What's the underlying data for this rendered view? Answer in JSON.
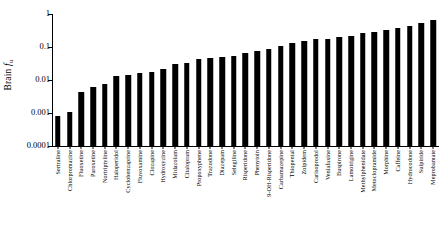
{
  "chart_data": {
    "type": "bar",
    "title": "",
    "subtitle": "",
    "xlabel": "",
    "ylabel": "Brain fu",
    "ylabel_parts": {
      "prefix": "Brain ",
      "italic": "f",
      "subscript": "u"
    },
    "yscale": "log",
    "ylim": [
      0.0001,
      1
    ],
    "ytick_labels": [
      "1",
      "0.1",
      "0.01",
      "0.001",
      "0.0001"
    ],
    "ytick_values": [
      1,
      0.1,
      0.01,
      0.001,
      0.0001
    ],
    "grid": false,
    "legend": null,
    "bar_color": "#000000",
    "categories": [
      "Sertraline",
      "Chlorpromazine",
      "Fluoxetine",
      "Paroxetine",
      "Nortriptyline",
      "Haloperidol",
      "Cyclobenzaprine",
      "Fluvoxamine",
      "Clozapine",
      "Hydroxyzine",
      "Midazolam",
      "Citalopram",
      "Propoxyphene",
      "Trazodone",
      "Diazepam",
      "Selegiline",
      "Risperidone",
      "Phenytoin",
      "9-OH-Risperidone",
      "Carbamazepine",
      "Thiopental",
      "Zolpidem",
      "Carisoprodol",
      "Venlafaxine",
      "Buspirone",
      "Lamotrigine",
      "Methylphenidate",
      "Metoclopramide",
      "Morphine",
      "Caffeine",
      "Hydrocodone",
      "Sulpiride",
      "Meprobamate"
    ],
    "values": [
      0.0008,
      0.0011,
      0.0042,
      0.0062,
      0.0075,
      0.013,
      0.014,
      0.016,
      0.017,
      0.021,
      0.031,
      0.032,
      0.042,
      0.048,
      0.049,
      0.055,
      0.068,
      0.075,
      0.085,
      0.11,
      0.13,
      0.15,
      0.17,
      0.18,
      0.2,
      0.22,
      0.26,
      0.29,
      0.33,
      0.38,
      0.44,
      0.52,
      0.68
    ]
  }
}
